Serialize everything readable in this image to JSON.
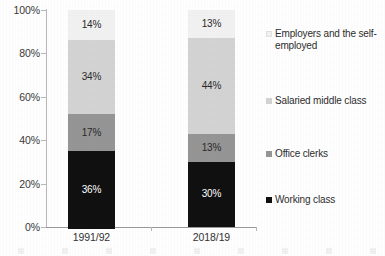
{
  "chart_data": {
    "type": "bar",
    "subtype": "100% stacked bar",
    "title": "",
    "xlabel": "",
    "ylabel": "",
    "ylim": [
      0,
      100
    ],
    "grid": false,
    "legend_position": "right",
    "categories": [
      "1991/92",
      "2018/19"
    ],
    "y_ticks": [
      "0%",
      "20%",
      "40%",
      "60%",
      "80%",
      "100%"
    ],
    "y_tick_values": [
      0,
      20,
      40,
      60,
      80,
      100
    ],
    "stack_order_bottom_to_top": [
      "Working class",
      "Office clerks",
      "Salaried middle class",
      "Employers and the self-employed"
    ],
    "series": [
      {
        "name": "Working class",
        "color": "#111111",
        "values": [
          36,
          30
        ],
        "labels": [
          "36%",
          "30%"
        ]
      },
      {
        "name": "Office clerks",
        "color": "#969696",
        "values": [
          17,
          13
        ],
        "labels": [
          "17%",
          "13%"
        ]
      },
      {
        "name": "Salaried middle class",
        "color": "#d4d4d4",
        "values": [
          34,
          44
        ],
        "labels": [
          "34%",
          "44%"
        ]
      },
      {
        "name": "Employers and the self-employed",
        "color": "#f2f2f2",
        "values": [
          14,
          13
        ],
        "labels": [
          "14%",
          "13%"
        ]
      }
    ],
    "legend_entries": [
      {
        "label": "Employers and the self-employed",
        "color": "#f2f2f2"
      },
      {
        "label": "Salaried middle class",
        "color": "#d4d4d4"
      },
      {
        "label": "Office clerks",
        "color": "#969696"
      },
      {
        "label": "Working class",
        "color": "#111111"
      }
    ]
  },
  "axis": {
    "y_labels": [
      "100%",
      "80%",
      "60%",
      "40%",
      "20%",
      "0%"
    ]
  },
  "bars": [
    {
      "category": "1991/92",
      "segments": [
        {
          "name": "Employers and the self-employed",
          "label": "14%",
          "percent": 14,
          "color": "#f2f2f2",
          "text_tone": "on-light"
        },
        {
          "name": "Salaried middle class",
          "label": "34%",
          "percent": 34,
          "color": "#d4d4d4",
          "text_tone": "on-light"
        },
        {
          "name": "Office clerks",
          "label": "17%",
          "percent": 17,
          "color": "#969696",
          "text_tone": "on-light"
        },
        {
          "name": "Working class",
          "label": "36%",
          "percent": 36,
          "color": "#111111",
          "text_tone": "on-dark"
        }
      ]
    },
    {
      "category": "2018/19",
      "segments": [
        {
          "name": "Employers and the self-employed",
          "label": "13%",
          "percent": 13,
          "color": "#f2f2f2",
          "text_tone": "on-light"
        },
        {
          "name": "Salaried middle class",
          "label": "44%",
          "percent": 44,
          "color": "#d4d4d4",
          "text_tone": "on-light"
        },
        {
          "name": "Office clerks",
          "label": "13%",
          "percent": 13,
          "color": "#969696",
          "text_tone": "on-light"
        },
        {
          "name": "Working class",
          "label": "30%",
          "percent": 30,
          "color": "#111111",
          "text_tone": "on-dark"
        }
      ]
    }
  ],
  "legend": {
    "items": [
      {
        "label": "Employers and the self-employed",
        "color": "#f2f2f2",
        "top": 18
      },
      {
        "label": "Salaried middle class",
        "color": "#d4d4d4",
        "top": 85
      },
      {
        "label": "Office clerks",
        "color": "#969696",
        "top": 138
      },
      {
        "label": "Working class",
        "color": "#111111",
        "top": 184
      }
    ]
  }
}
